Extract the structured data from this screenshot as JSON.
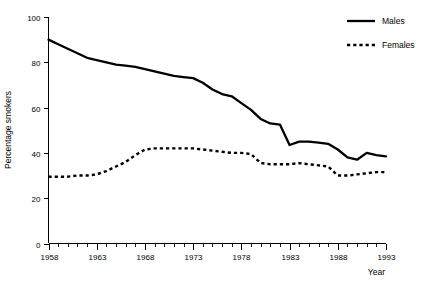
{
  "chart_data": {
    "type": "line",
    "title": "",
    "xlabel": "Year",
    "ylabel": "Percentage smokers",
    "xlim": [
      1958,
      1993
    ],
    "ylim": [
      0,
      100
    ],
    "grid": false,
    "legend_position": "top-right",
    "x": [
      1958,
      1959,
      1960,
      1961,
      1962,
      1963,
      1964,
      1965,
      1966,
      1967,
      1968,
      1969,
      1970,
      1971,
      1972,
      1973,
      1974,
      1975,
      1976,
      1977,
      1978,
      1979,
      1980,
      1981,
      1982,
      1983,
      1984,
      1985,
      1986,
      1987,
      1988,
      1989,
      1990,
      1991,
      1992,
      1993
    ],
    "xtick_labels": [
      "1958",
      "1963",
      "1968",
      "1973",
      "1978",
      "1983",
      "1988",
      "1993"
    ],
    "xtick_values": [
      1958,
      1963,
      1968,
      1973,
      1978,
      1983,
      1988,
      1993
    ],
    "xtick_minor_step": 1,
    "ytick_labels": [
      "0",
      "20",
      "40",
      "60",
      "80",
      "100"
    ],
    "ytick_values": [
      0,
      20,
      40,
      60,
      80,
      100
    ],
    "series": [
      {
        "name": "Males",
        "style": "solid",
        "color": "#000000",
        "values": [
          90,
          88,
          86,
          84,
          82,
          81,
          80,
          79,
          78.5,
          78,
          77,
          76,
          75,
          74,
          73.5,
          73,
          71,
          68,
          66,
          65,
          62,
          59,
          55,
          53,
          52.5,
          43.5,
          45,
          45,
          44.5,
          44,
          41.5,
          38,
          37,
          40,
          39,
          38.5
        ]
      },
      {
        "name": "Females",
        "style": "dotted",
        "color": "#000000",
        "values": [
          29.5,
          29.5,
          29.5,
          30,
          30,
          30.5,
          32,
          34,
          36,
          39,
          41.5,
          42,
          42,
          42,
          42,
          42,
          41.5,
          41,
          40.5,
          40,
          40,
          39.5,
          35.5,
          35,
          35,
          35,
          35.5,
          35,
          34.5,
          34,
          30,
          30,
          30.5,
          31,
          31.5,
          31.5
        ]
      }
    ]
  },
  "legend": {
    "items": [
      {
        "label": "Males",
        "style": "solid"
      },
      {
        "label": "Females",
        "style": "dotted"
      }
    ]
  },
  "axes": {
    "y_title": "Percentage smokers",
    "x_title": "Year"
  }
}
